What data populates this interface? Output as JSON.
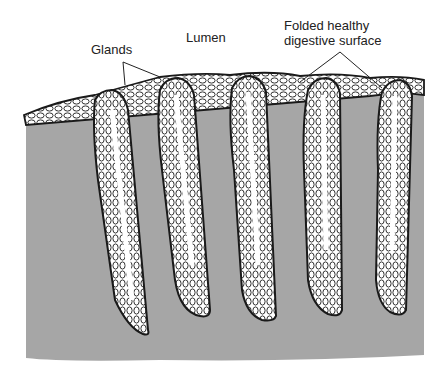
{
  "labels": {
    "glands": "Glands",
    "lumen": "Lumen",
    "surface_line1": "Folded healthy",
    "surface_line2": "digestive surface"
  },
  "colors": {
    "tissue": "#a6a6a6",
    "outline": "#1a1a1a",
    "cells": "#ffffff",
    "background": "#ffffff"
  }
}
